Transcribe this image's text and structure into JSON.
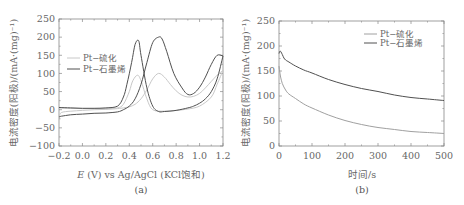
{
  "chart_data": [
    {
      "id": "a",
      "type": "line",
      "panel_label": "(a)",
      "title": "",
      "xlabel": "E (V) vs Ag/AgCl (KCl饱和)",
      "xlabel_italic_part": "E",
      "xlabel_rest": " (V) vs Ag/AgCl (KCl饱和)",
      "ylabel": "电流密度(阳极)/(mA·(mg)⁻¹)",
      "xlim": [
        -0.2,
        1.2
      ],
      "ylim": [
        -100,
        250
      ],
      "xticks": [
        -0.2,
        0.0,
        0.2,
        0.4,
        0.6,
        0.8,
        1.0,
        1.2
      ],
      "xtick_labels": [
        "−0.2",
        "0.0",
        "0.2",
        "0.4",
        "0.6",
        "0.8",
        "1.0",
        "1.2"
      ],
      "yticks": [
        -100,
        -50,
        0,
        50,
        100,
        150,
        200,
        250
      ],
      "ytick_labels": [
        "−100",
        "−50",
        "0",
        "50",
        "100",
        "150",
        "200",
        "250"
      ],
      "grid": false,
      "legend_position": "upper-left",
      "series": [
        {
          "name": "Pt−硫化",
          "color": "#c8c8c8",
          "forward_scan": {
            "x": [
              -0.2,
              -0.18,
              -0.1,
              0.0,
              0.1,
              0.2,
              0.3,
              0.35,
              0.4,
              0.45,
              0.5,
              0.55,
              0.6,
              0.65,
              0.7,
              0.75,
              0.8,
              0.85,
              0.9,
              0.95,
              1.0,
              1.05,
              1.1,
              1.15,
              1.2
            ],
            "y": [
              -20,
              -8,
              -4,
              -2,
              0,
              1,
              3,
              5,
              8,
              15,
              30,
              55,
              85,
              100,
              90,
              70,
              52,
              40,
              35,
              37,
              45,
              60,
              78,
              95,
              108
            ]
          },
          "reverse_scan": {
            "x": [
              1.2,
              1.15,
              1.1,
              1.0,
              0.9,
              0.8,
              0.7,
              0.6,
              0.55,
              0.5,
              0.47,
              0.43,
              0.4,
              0.35,
              0.3,
              0.2,
              0.1,
              0.0,
              -0.1,
              -0.2
            ],
            "y": [
              108,
              70,
              35,
              10,
              2,
              -2,
              -4,
              0,
              30,
              80,
              95,
              80,
              50,
              15,
              5,
              3,
              3,
              3,
              4,
              5
            ]
          }
        },
        {
          "name": "Pt−石墨烯",
          "color": "#505050",
          "forward_scan": {
            "x": [
              -0.2,
              -0.18,
              -0.1,
              0.0,
              0.1,
              0.2,
              0.3,
              0.35,
              0.4,
              0.45,
              0.5,
              0.55,
              0.6,
              0.65,
              0.68,
              0.72,
              0.78,
              0.85,
              0.9,
              0.95,
              1.0,
              1.05,
              1.1,
              1.15,
              1.2
            ],
            "y": [
              -20,
              -18,
              -14,
              -12,
              -10,
              -9,
              -6,
              0,
              10,
              30,
              70,
              130,
              185,
              200,
              195,
              160,
              100,
              60,
              42,
              45,
              62,
              90,
              125,
              150,
              148
            ]
          },
          "reverse_scan": {
            "x": [
              1.2,
              1.15,
              1.1,
              1.05,
              1.0,
              0.95,
              0.9,
              0.8,
              0.7,
              0.65,
              0.6,
              0.55,
              0.5,
              0.48,
              0.45,
              0.42,
              0.38,
              0.35,
              0.3,
              0.2,
              0.1,
              0.0,
              -0.1,
              -0.2
            ],
            "y": [
              148,
              85,
              50,
              30,
              18,
              10,
              5,
              -2,
              -5,
              -5,
              10,
              60,
              150,
              190,
              180,
              130,
              70,
              35,
              10,
              5,
              4,
              4,
              5,
              6
            ]
          }
        }
      ]
    },
    {
      "id": "b",
      "type": "line",
      "panel_label": "(b)",
      "title": "",
      "xlabel": "时间/s",
      "ylabel": "电流密度(阳极)/(mA·(mg)⁻¹)",
      "xlim": [
        0,
        500
      ],
      "ylim": [
        0,
        250
      ],
      "xticks": [
        0,
        100,
        200,
        300,
        400,
        500
      ],
      "xtick_labels": [
        "0",
        "100",
        "200",
        "300",
        "400",
        "500"
      ],
      "yticks": [
        0,
        50,
        100,
        150,
        200,
        250
      ],
      "ytick_labels": [
        "0",
        "50",
        "100",
        "150",
        "200",
        "250"
      ],
      "grid": false,
      "legend_position": "upper-right",
      "series": [
        {
          "name": "Pt−硫化",
          "color": "#a0a0a0",
          "x": [
            0,
            2,
            5,
            10,
            20,
            30,
            50,
            75,
            100,
            150,
            200,
            250,
            300,
            350,
            400,
            450,
            500
          ],
          "y": [
            160,
            150,
            138,
            125,
            112,
            104,
            95,
            84,
            76,
            62,
            51,
            43,
            37,
            33,
            29,
            27,
            25
          ]
        },
        {
          "name": "Pt−石墨烯",
          "color": "#505050",
          "x": [
            0,
            3,
            6,
            10,
            15,
            20,
            30,
            50,
            75,
            100,
            150,
            200,
            250,
            300,
            350,
            400,
            450,
            500
          ],
          "y": [
            185,
            190,
            188,
            183,
            176,
            172,
            168,
            160,
            152,
            146,
            133,
            123,
            115,
            109,
            102,
            97,
            94,
            91
          ]
        }
      ]
    }
  ],
  "panels": {
    "a": {
      "panel_label": "(a)",
      "xlabel_italic": "E",
      "xlabel_rest": " (V) vs Ag/AgCl (KCl饱和)",
      "ylabel": "电流密度(阳极)/(mA·(mg)⁻¹)",
      "legend": [
        "Pt−硫化",
        "Pt−石墨烯"
      ]
    },
    "b": {
      "panel_label": "(b)",
      "xlabel": "时间/s",
      "ylabel": "电流密度(阳极)/(mA·(mg)⁻¹)",
      "legend": [
        "Pt−硫化",
        "Pt−石墨烯"
      ]
    }
  }
}
